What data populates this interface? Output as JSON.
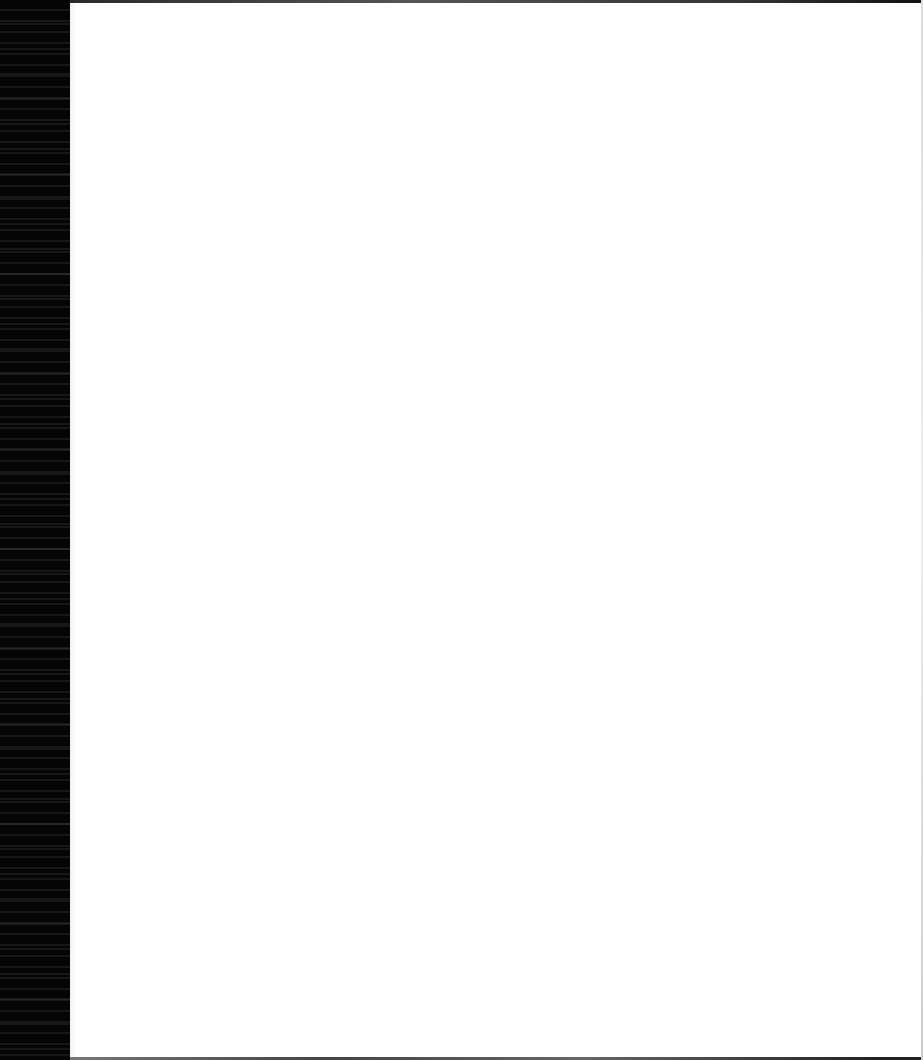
{
  "document": {
    "type": "scanned-page",
    "state": "blank",
    "text": ""
  },
  "colors": {
    "binding": "#050505",
    "page": "#ffffff",
    "edge": "#333333"
  }
}
